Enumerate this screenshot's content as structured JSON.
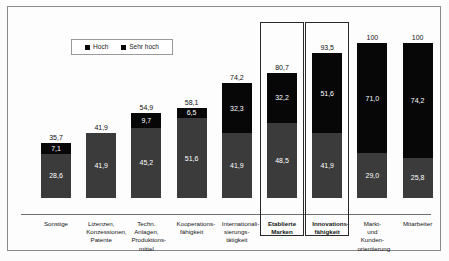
{
  "legend": {
    "entries": [
      {
        "label": "Hoch",
        "color": "#070707",
        "icon": "square-marker-icon"
      },
      {
        "label": "Sehr hoch",
        "color": "#3b3b3b",
        "icon": "square-marker-icon"
      }
    ]
  },
  "chart_data": {
    "type": "bar",
    "subtype": "stacked-vertical",
    "title": "",
    "xlabel": "",
    "ylabel": "",
    "ylim": [
      0,
      100
    ],
    "grid": false,
    "legend_position": "top-left-inside",
    "categories": [
      "Sonstige",
      "Lizenzen,\nKonzessionen,\nPatente",
      "Techn.\nAnlagen,\nProduktions-\nmittel",
      "Kooperations-\nfähigkeit",
      "Internationali-\nsierungs-\ntätigkeit",
      "Etablierte\nMarken",
      "Innovations-\nfähigkeit",
      "Markt-\nund\nKunden-\norientierung",
      "Mitarbeiter"
    ],
    "series": [
      {
        "name": "Sehr hoch",
        "color": "#3b3b3b",
        "values": [
          28.6,
          41.9,
          45.2,
          51.6,
          41.9,
          48.5,
          41.9,
          29.0,
          25.8
        ],
        "labels": [
          "28,6",
          "41,9",
          "45,2",
          "51,6",
          "41,9",
          "48,5",
          "41,9",
          "29,0",
          "25,8"
        ]
      },
      {
        "name": "Hoch",
        "color": "#070707",
        "values": [
          7.1,
          0,
          9.7,
          6.5,
          32.3,
          32.2,
          51.6,
          71.0,
          74.2
        ],
        "labels": [
          "7,1",
          "",
          "9,7",
          "6,5",
          "32,3",
          "32,2",
          "51,6",
          "71,0",
          "74,2"
        ]
      }
    ],
    "totals": [
      35.7,
      41.9,
      54.9,
      58.1,
      74.2,
      80.7,
      93.5,
      100,
      100
    ],
    "total_labels": [
      "35,7",
      "41,9",
      "54,9",
      "58,1",
      "74,2",
      "80,7",
      "93,5",
      "100",
      "100"
    ],
    "highlighted_categories": [
      "Etablierte\nMarken",
      "Innovations-\nfähigkeit"
    ]
  }
}
